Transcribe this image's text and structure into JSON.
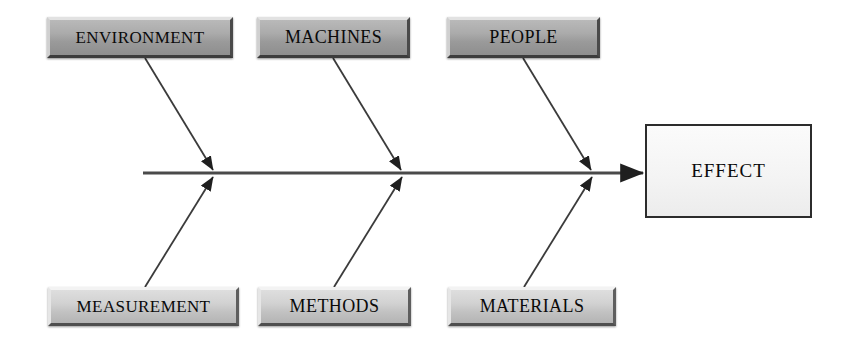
{
  "diagram": {
    "type": "fishbone-ishikawa",
    "title": "",
    "spine": {
      "label": "spine-arrow",
      "from_x": 143,
      "to_x": 643,
      "y": 173,
      "color": "#4a4a4a"
    },
    "effect": {
      "label": "EFFECT",
      "x": 645,
      "y": 124,
      "width": 167,
      "height": 94,
      "fill": "#f5f5f5",
      "border": "#2c2c2c"
    },
    "top_causes": [
      {
        "label": "ENVIRONMENT",
        "x": 47,
        "y": 17,
        "width": 186,
        "height": 41,
        "fill": "#a5a5a5",
        "rib": {
          "x1": 145,
          "y1": 58,
          "x2": 213,
          "y2": 170
        }
      },
      {
        "label": "MACHINES",
        "x": 257,
        "y": 17,
        "width": 153,
        "height": 41,
        "fill": "#a5a5a5",
        "rib": {
          "x1": 333,
          "y1": 58,
          "x2": 401,
          "y2": 170
        }
      },
      {
        "label": "PEOPLE",
        "x": 447,
        "y": 17,
        "width": 153,
        "height": 41,
        "fill": "#a5a5a5",
        "rib": {
          "x1": 523,
          "y1": 58,
          "x2": 591,
          "y2": 170
        }
      }
    ],
    "bottom_causes": [
      {
        "label": "MEASUREMENT",
        "x": 48,
        "y": 287,
        "width": 191,
        "height": 39,
        "fill": "#cccccc",
        "rib": {
          "x1": 145,
          "y1": 287,
          "x2": 213,
          "y2": 177
        }
      },
      {
        "label": "METHODS",
        "x": 258,
        "y": 287,
        "width": 153,
        "height": 39,
        "fill": "#cccccc",
        "rib": {
          "x1": 334,
          "y1": 287,
          "x2": 402,
          "y2": 177
        }
      },
      {
        "label": "MATERIALS",
        "x": 448,
        "y": 287,
        "width": 168,
        "height": 39,
        "fill": "#cccccc",
        "rib": {
          "x1": 524,
          "y1": 287,
          "x2": 592,
          "y2": 177
        }
      }
    ]
  }
}
